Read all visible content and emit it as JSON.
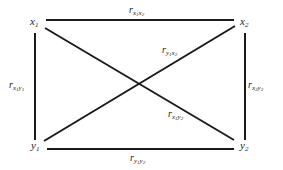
{
  "diagram": {
    "nodes": [
      {
        "id": "x1",
        "var": "x",
        "sub": "1"
      },
      {
        "id": "x2",
        "var": "x",
        "sub": "2"
      },
      {
        "id": "y1",
        "var": "y",
        "sub": "1"
      },
      {
        "id": "y2",
        "var": "y",
        "sub": "2"
      }
    ],
    "edges": [
      {
        "from": "x1",
        "to": "x2",
        "label": "r",
        "a": "x",
        "as": "1",
        "b": "x",
        "bs": "2"
      },
      {
        "from": "y1",
        "to": "y2",
        "label": "r",
        "a": "y",
        "as": "1",
        "b": "y",
        "bs": "2"
      },
      {
        "from": "x1",
        "to": "y1",
        "label": "r",
        "a": "x",
        "as": "1",
        "b": "y",
        "bs": "1"
      },
      {
        "from": "x2",
        "to": "y2",
        "label": "r",
        "a": "x",
        "as": "2",
        "b": "y",
        "bs": "2"
      },
      {
        "from": "y1",
        "to": "x2",
        "label": "r",
        "a": "y",
        "as": "1",
        "b": "x",
        "bs": "2"
      },
      {
        "from": "x1",
        "to": "y2",
        "label": "r",
        "a": "x",
        "as": "1",
        "b": "y",
        "bs": "2"
      }
    ],
    "line_color": "#1a1a1a"
  }
}
